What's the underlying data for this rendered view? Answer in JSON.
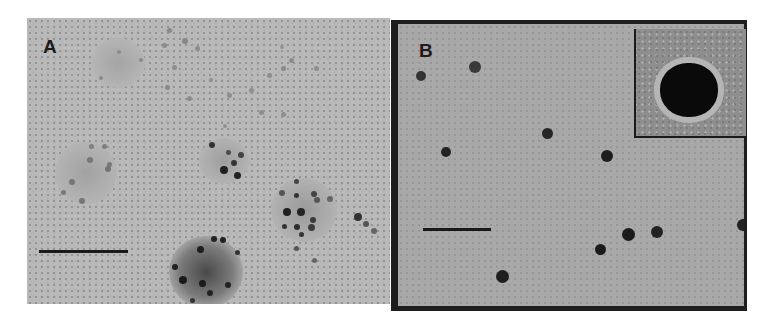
{
  "figure": {
    "panels": [
      {
        "id": "A",
        "label": "A",
        "description": "TEM micrograph: clusters of nanoparticles aggregated on diffuse gray domains",
        "scale_bar": "present (unlabeled)",
        "clusters": [
          {
            "name": "top-left cluster",
            "x": 118,
            "y": 62,
            "r": 26,
            "shade": "light"
          },
          {
            "name": "left cluster",
            "x": 86,
            "y": 172,
            "r": 30,
            "shade": "light"
          },
          {
            "name": "center cluster",
            "x": 222,
            "y": 162,
            "r": 22,
            "shade": "medium"
          },
          {
            "name": "right cluster",
            "x": 300,
            "y": 206,
            "r": 30,
            "shade": "medium"
          },
          {
            "name": "bottom cluster",
            "x": 206,
            "y": 264,
            "r": 36,
            "shade": "dark"
          }
        ]
      },
      {
        "id": "B",
        "label": "B",
        "description": "TEM micrograph: isolated dispersed spherical nanoparticles",
        "scale_bar": "present (unlabeled)",
        "inset": "high-magnification view of a single nanoparticle",
        "particle_count_visible": 11
      }
    ]
  }
}
